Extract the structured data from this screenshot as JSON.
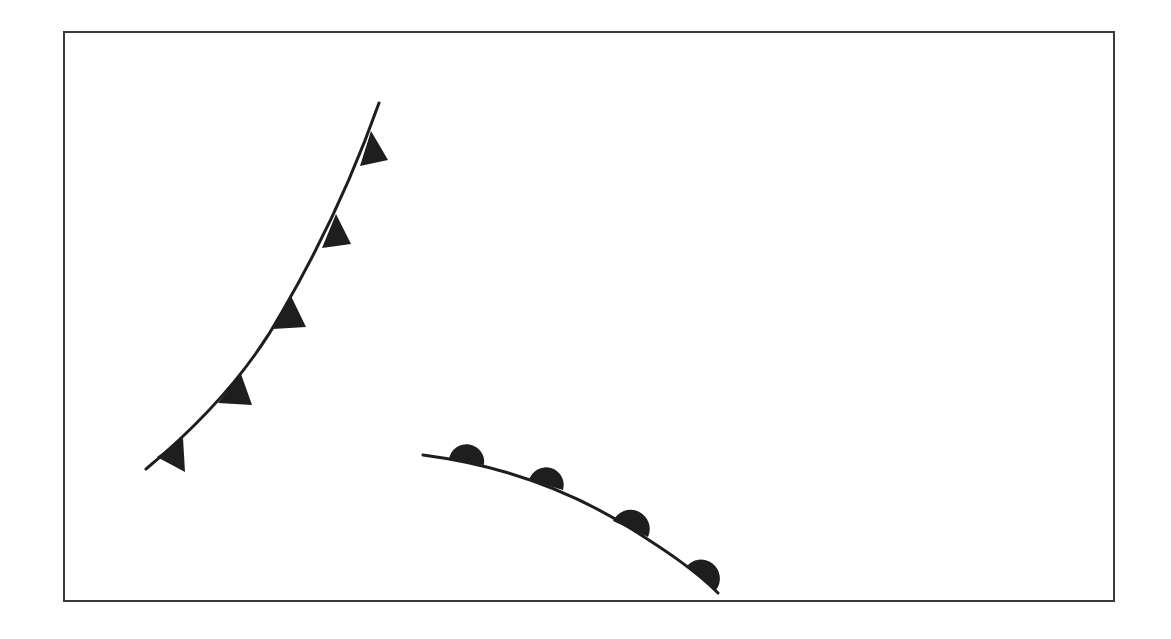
{
  "diagram": {
    "type": "weather-fronts",
    "frame": {
      "x": 64,
      "y": 32,
      "width": 1050,
      "height": 569,
      "stroke": "#3a3a3a"
    },
    "colors": {
      "line": "#1e1e1e",
      "symbol": "#1e1e1e",
      "background": "#ffffff"
    },
    "fronts": [
      {
        "name": "cold-front",
        "label": "Cold front",
        "symbol": "triangle",
        "path": "M146,469 C 205,420 250,370 282,312 C 318,250 350,185 379,103",
        "symbols": [
          {
            "base": [
              [
                371,
                131
              ],
              [
                360,
                166
              ]
            ],
            "apex": [
              388,
              160
            ]
          },
          {
            "base": [
              [
                336,
                214
              ],
              [
                322,
                248
              ]
            ],
            "apex": [
              351,
              244
            ]
          },
          {
            "base": [
              [
                291,
                296
              ],
              [
                273,
                329
              ]
            ],
            "apex": [
              306,
              327
            ]
          },
          {
            "base": [
              [
                241,
                374
              ],
              [
                218,
                403
              ]
            ],
            "apex": [
              252,
              405
            ]
          },
          {
            "base": [
              [
                183,
                438
              ],
              [
                157,
                457
              ]
            ],
            "apex": [
              185,
              472
            ]
          }
        ]
      },
      {
        "name": "warm-front",
        "label": "Warm front",
        "symbol": "semicircle",
        "path": "M423,455 C 500,465 570,490 630,528 C 665,550 695,570 718,593",
        "symbols": [
          {
            "start": [
              449,
              459
            ],
            "end": [
              484,
              465
            ]
          },
          {
            "start": [
              529,
              480
            ],
            "end": [
              563,
              490
            ]
          },
          {
            "start": [
              613,
              521
            ],
            "end": [
              648,
              537
            ]
          },
          {
            "start": [
              686,
              567
            ],
            "end": [
              716,
              590
            ]
          }
        ]
      }
    ]
  }
}
